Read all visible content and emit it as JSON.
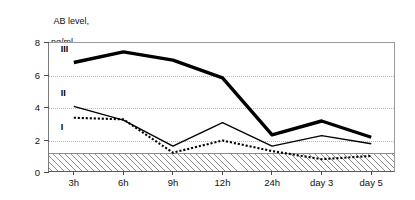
{
  "chart_data": {
    "type": "line",
    "title": "",
    "xlabel": "",
    "ylabel": "AB level, ng/ml",
    "ylabel_line1": "AB level,",
    "ylabel_line2": "ng/ml",
    "categories": [
      "3h",
      "6h",
      "9h",
      "12h",
      "24h",
      "day 3",
      "day 5"
    ],
    "yticks": [
      0,
      2,
      4,
      6,
      8
    ],
    "ylim": [
      0,
      8
    ],
    "grid": "horizontal-dotted-at-2-4-6",
    "legend": "inline-series-labels",
    "series": [
      {
        "name": "I",
        "style": "dotted",
        "label_x_category": "3h",
        "values": [
          3.4,
          3.3,
          1.25,
          2.0,
          1.35,
          0.85,
          1.05
        ]
      },
      {
        "name": "II",
        "style": "thin-solid",
        "label_x_category": "3h",
        "values": [
          4.1,
          3.25,
          1.65,
          3.1,
          1.65,
          2.3,
          1.8
        ]
      },
      {
        "name": "III",
        "style": "thick-solid",
        "label_x_category": "3h",
        "values": [
          6.8,
          7.45,
          6.95,
          5.85,
          2.35,
          3.2,
          2.2
        ]
      }
    ],
    "shaded_band": {
      "name": "reference-range",
      "pattern": "diagonal-hatch",
      "from": 0,
      "to": 1.25
    },
    "colors": {
      "series_line": "#000000",
      "grid": "#b9b9b9",
      "axis": "#4a4a4a",
      "hatch": "#8e8e8e",
      "background": "#ffffff"
    }
  }
}
